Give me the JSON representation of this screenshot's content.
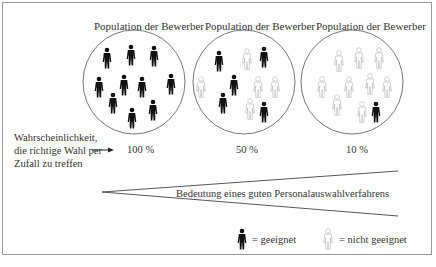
{
  "populations": [
    {
      "title": "Population der Bewerber",
      "probability": "100 %",
      "suitable": 10,
      "unsuitable": 0
    },
    {
      "title": "Population der Bewerber",
      "probability": "50 %",
      "suitable": 5,
      "unsuitable": 5
    },
    {
      "title": "Population der Bewerber",
      "probability": "10 %",
      "suitable": 1,
      "unsuitable": 9
    }
  ],
  "probability_label": {
    "line1": "Wahrscheinlichkeit,",
    "line2": "die richtige Wahl per",
    "line3": "Zufall zu treffen"
  },
  "wedge_label": "Bedeutung eines guten Personalauswahlverfahrens",
  "legend": {
    "suitable": "= geeignet",
    "unsuitable": "= nicht geeignet"
  },
  "colors": {
    "suitable": "#111111",
    "unsuitable": "#bdbdbd",
    "line": "#555555"
  }
}
